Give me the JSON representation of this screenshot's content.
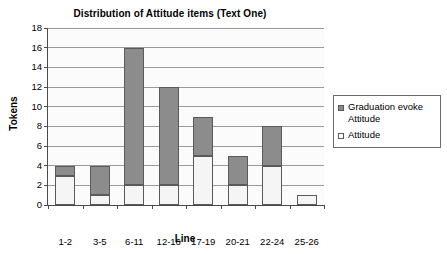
{
  "chart_data": {
    "type": "bar",
    "title": "Distribution of Attitude items (Text One)",
    "xlabel": "Line",
    "ylabel": "Tokens",
    "categories": [
      "1-2",
      "3-5",
      "6-11",
      "12-16",
      "17-19",
      "20-21",
      "22-24",
      "25-26"
    ],
    "series": [
      {
        "name": "Attitude",
        "values": [
          3,
          1,
          2,
          2,
          5,
          2,
          4,
          1
        ]
      },
      {
        "name": "Graduation evoke Attitude",
        "values": [
          1,
          3,
          14,
          10,
          4,
          3,
          4,
          0
        ]
      }
    ],
    "totals": [
      4,
      4,
      16,
      12,
      9,
      5,
      8,
      1
    ],
    "stacked": true,
    "ylim": [
      0,
      18
    ],
    "ytick_labels": [
      "0",
      "2",
      "4",
      "6",
      "8",
      "10",
      "12",
      "14",
      "16",
      "18"
    ],
    "ytick_values": [
      0,
      2,
      4,
      6,
      8,
      10,
      12,
      14,
      16,
      18
    ],
    "grid": true,
    "legend_position": "right",
    "colors": {
      "graduation_evoke_attitude": "#8c8c8c",
      "attitude": "#f5f5f5",
      "gridline": "#9a9a9a",
      "axis": "#4a4a4a",
      "plot_background": "#fbfbfb"
    }
  },
  "legend": {
    "items": [
      {
        "label": "Graduation evoke Attitude",
        "swatch": "grad"
      },
      {
        "label": "Attitude",
        "swatch": "att"
      }
    ]
  }
}
